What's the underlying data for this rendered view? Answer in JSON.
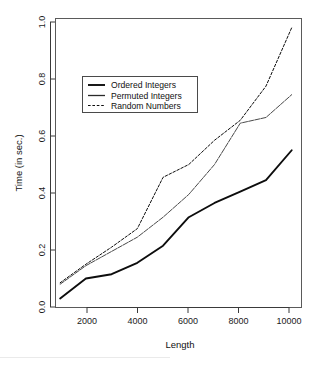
{
  "chart_data": {
    "type": "line",
    "title": "",
    "xlabel": "Length",
    "ylabel": "Time (in sec.)",
    "xlim": [
      800,
      10400
    ],
    "ylim": [
      0.0,
      1.0
    ],
    "grid": false,
    "legend_position": "upper left",
    "x_ticks": [
      2000,
      4000,
      6000,
      8000,
      10000
    ],
    "x_tick_labels": [
      "2000",
      "4000",
      "6000",
      "8000",
      "10000"
    ],
    "y_ticks": [
      0.0,
      0.2,
      0.4,
      0.6,
      0.8,
      1.0
    ],
    "y_tick_labels": [
      "0.0",
      "0.2",
      "0.4",
      "0.6",
      "0.8",
      "1.0"
    ],
    "x": [
      1000,
      2000,
      3000,
      4000,
      5000,
      6000,
      7000,
      8000,
      9000,
      10000
    ],
    "series": [
      {
        "name": "Ordered Integers",
        "line_style": "solid",
        "line_width": "thick",
        "color": "#0d0d0d",
        "values": [
          0.03,
          0.1,
          0.115,
          0.155,
          0.215,
          0.315,
          0.365,
          0.405,
          0.445,
          0.55
        ]
      },
      {
        "name": "Permuted Integers",
        "line_style": "solid-thin",
        "line_width": "thin",
        "color": "#4a4a4a",
        "values": [
          0.08,
          0.145,
          0.195,
          0.245,
          0.315,
          0.395,
          0.5,
          0.645,
          0.665,
          0.745
        ]
      },
      {
        "name": "Random Numbers",
        "line_style": "dashed",
        "line_width": "thin",
        "color": "#0d0d0d",
        "values": [
          0.085,
          0.15,
          0.21,
          0.275,
          0.455,
          0.5,
          0.585,
          0.655,
          0.775,
          0.98
        ]
      }
    ],
    "legend_entries": [
      {
        "label": "Ordered Integers",
        "style": "solid-thick"
      },
      {
        "label": "Permuted Integers",
        "style": "solid-thin"
      },
      {
        "label": "Random Numbers",
        "style": "dashed"
      }
    ]
  },
  "figure": {
    "background_color": "#ffffff",
    "axis_color": "#3a3a3a",
    "frame_color": "#5a5a5a"
  }
}
